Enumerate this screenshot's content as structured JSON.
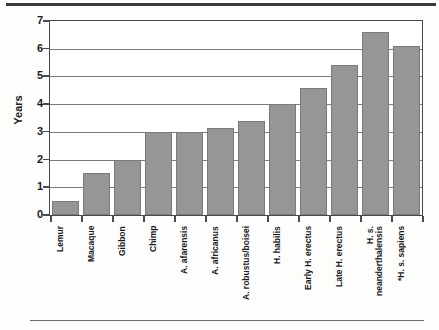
{
  "chart_data": {
    "type": "bar",
    "title": "",
    "xlabel": "",
    "ylabel": "Years",
    "ylim": [
      0,
      7
    ],
    "ytick_labels": [
      "0",
      "1",
      "2",
      "3",
      "4",
      "5",
      "6",
      "7"
    ],
    "grid": true,
    "legend": "none",
    "bar_color": "#969696",
    "bar_edge_color": "#7a7a7a",
    "categories": [
      "Lemur",
      "Macaque",
      "Gibbon",
      "Chimp",
      "A. afarensis",
      "A. africanus",
      "A. robustus/boisei",
      "H. habilis",
      "Early H. erectus",
      "Late H. erectus",
      "H. s.\nneanderthalensis",
      "*H. s. sapiens"
    ],
    "values": [
      0.5,
      1.5,
      2.0,
      3.0,
      3.0,
      3.15,
      3.4,
      4.0,
      4.6,
      5.4,
      6.6,
      6.1
    ]
  }
}
